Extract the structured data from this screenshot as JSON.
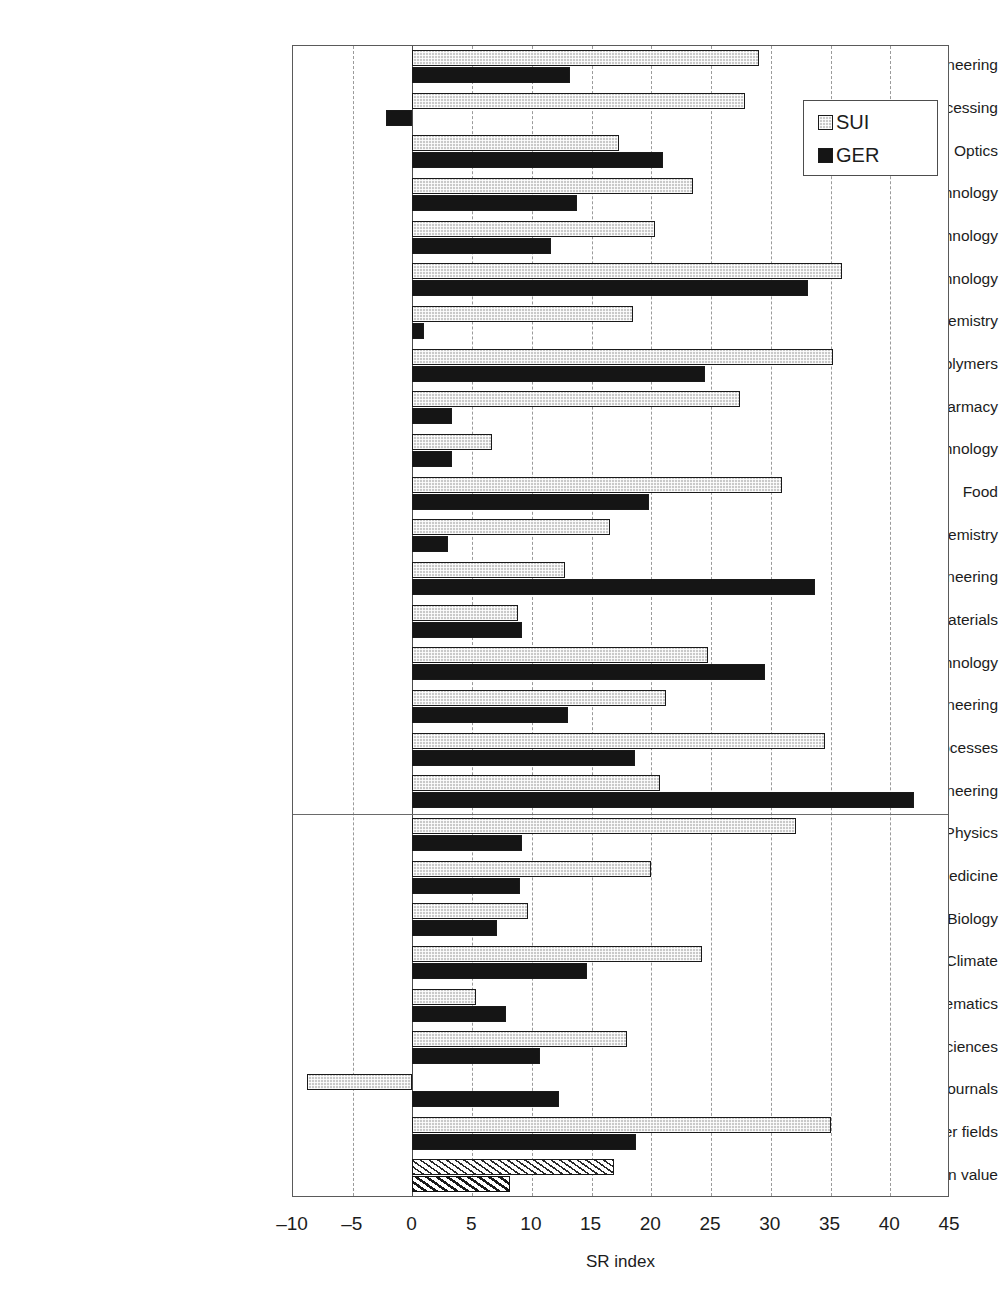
{
  "chart_data": {
    "type": "bar",
    "orientation": "horizontal",
    "title": "",
    "xlabel": "SR index",
    "ylabel": "",
    "xlim": [
      -10,
      45
    ],
    "xticks": [
      -10,
      -5,
      0,
      5,
      10,
      15,
      20,
      25,
      30,
      35,
      40,
      45
    ],
    "xtick_labels": [
      "–10",
      "–5",
      "0",
      "5",
      "10",
      "15",
      "20",
      "25",
      "30",
      "35",
      "40",
      "45"
    ],
    "grid": true,
    "grid_axis": "x",
    "grid_style": "dashed",
    "legend": {
      "position": "top-right",
      "entries": [
        {
          "name": "SUI",
          "style": "stippled-gray"
        },
        {
          "name": "GER",
          "style": "solid-black"
        }
      ]
    },
    "group_separator_after": "Civil Engineering",
    "categories": [
      "Electrical Engineering",
      "Data Processing",
      "Optics",
      "Control Technology",
      "Medical Technology",
      "Nuclear Technology",
      "Organic Chemistry",
      "Polymers",
      "Pharmacy",
      "Biotechnology",
      "Food",
      "Basic Chemistry",
      "Process Engineering",
      "Materials",
      "Environmental Technology",
      "Mechanical Engineering",
      "Thermal Processes",
      "Civil Engineering",
      "Physics",
      "Medicine",
      "Biology",
      "Ecology, Climate",
      "Mathematics",
      "Geosciences",
      "Multidisciplinary Journals",
      "Other fields",
      "Mean value"
    ],
    "series": [
      {
        "name": "SUI",
        "color": "#c9c9c9",
        "values": [
          29.0,
          27.8,
          17.3,
          23.5,
          20.3,
          36.0,
          18.5,
          35.2,
          27.4,
          6.7,
          30.9,
          16.5,
          12.8,
          8.8,
          24.7,
          21.2,
          34.5,
          20.7,
          32.1,
          20.0,
          9.7,
          24.2,
          5.3,
          18.0,
          -8.8,
          35.0,
          16.9
        ]
      },
      {
        "name": "GER",
        "color": "#151515",
        "values": [
          13.2,
          -2.2,
          21.0,
          13.8,
          11.6,
          33.1,
          1.0,
          24.5,
          3.3,
          3.3,
          19.8,
          3.0,
          33.7,
          9.2,
          29.5,
          13.0,
          18.6,
          42.0,
          9.2,
          9.0,
          7.1,
          14.6,
          7.8,
          10.7,
          12.3,
          18.7,
          8.2
        ]
      }
    ]
  }
}
